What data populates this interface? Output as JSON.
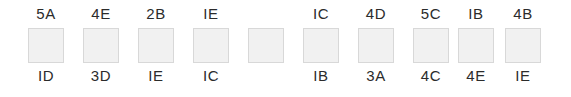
{
  "strip": {
    "background_color": "#ffffff",
    "swatch_fill_color": "#f1f1f1",
    "swatch_border_color": "#d8d8d8",
    "label_color": "#2b2b2b",
    "count": 10,
    "cells": [
      {
        "top_label": "5A",
        "bottom_label": "ID"
      },
      {
        "top_label": "4E",
        "bottom_label": "3D"
      },
      {
        "top_label": "2B",
        "bottom_label": "IE"
      },
      {
        "top_label": "IE",
        "bottom_label": "IC"
      },
      {
        "top_label": "",
        "bottom_label": ""
      },
      {
        "top_label": "IC",
        "bottom_label": "IB"
      },
      {
        "top_label": "4D",
        "bottom_label": "3A"
      },
      {
        "top_label": "5C",
        "bottom_label": "4C"
      },
      {
        "top_label": "IB",
        "bottom_label": "4E"
      },
      {
        "top_label": "4B",
        "bottom_label": "IE"
      }
    ]
  }
}
